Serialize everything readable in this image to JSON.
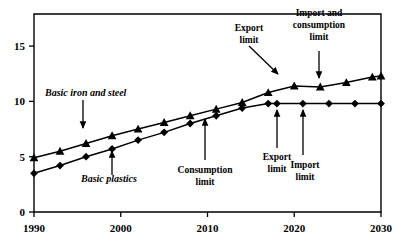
{
  "chart_data": {
    "type": "line",
    "title": "",
    "xlabel": "",
    "ylabel": "",
    "xlim": [
      1990,
      2030
    ],
    "ylim": [
      0,
      17.9
    ],
    "grid": false,
    "legend_position": "none",
    "xticks": [
      1990,
      2000,
      2010,
      2020,
      2030
    ],
    "xticklabels": [
      "1990",
      "2000",
      "2010",
      "2020",
      "2030"
    ],
    "yticks": [
      0,
      5,
      10,
      15
    ],
    "yticklabels": [
      "0",
      "5",
      "10",
      "15"
    ],
    "series": [
      {
        "name": "Basic iron and steel",
        "marker": "triangle",
        "x": [
          1990,
          1993,
          1996,
          1999,
          2002,
          2005,
          2008,
          2011,
          2014,
          2017,
          2020,
          2023,
          2026,
          2029,
          2030
        ],
        "values": [
          4.9,
          5.5,
          6.2,
          6.9,
          7.5,
          8.1,
          8.7,
          9.3,
          9.9,
          10.8,
          11.4,
          11.3,
          11.7,
          12.2,
          12.3
        ]
      },
      {
        "name": "Basic plastics",
        "marker": "diamond",
        "x": [
          1990,
          1993,
          1996,
          1999,
          2002,
          2005,
          2008,
          2011,
          2014,
          2017,
          2018,
          2021,
          2024,
          2027,
          2030
        ],
        "values": [
          3.5,
          4.2,
          5.0,
          5.7,
          6.5,
          7.2,
          8.0,
          8.7,
          9.4,
          9.8,
          9.8,
          9.8,
          9.8,
          9.8,
          9.8
        ]
      }
    ],
    "annotations": [
      {
        "id": "basic-iron-and-steel",
        "text": "Basic iron and steel",
        "style": "series-label",
        "point_x": 1999,
        "point_y": 6.9
      },
      {
        "id": "basic-plastics",
        "text": "Basic plastics",
        "style": "series-label",
        "point_x": 1999,
        "point_y": 5.7
      },
      {
        "id": "export-limit-top",
        "text": "Export limit",
        "line1": "Export",
        "line2": "limit",
        "style": "callout",
        "point_x": 2017,
        "point_y": 10.8
      },
      {
        "id": "import-and-consumption-limit",
        "text": "Import and consumption limit",
        "line1": "Import and",
        "line2": "consumption",
        "line3": "limit",
        "style": "callout",
        "point_x": 2023,
        "point_y": 11.3
      },
      {
        "id": "consumption-limit",
        "text": "Consumption limit",
        "line1": "Consumption",
        "line2": "limit",
        "style": "callout",
        "point_x": 2011,
        "point_y": 8.7
      },
      {
        "id": "export-limit-bottom",
        "text": "Export limit",
        "line1": "Export",
        "line2": "limit",
        "style": "callout",
        "point_x": 2018,
        "point_y": 9.8
      },
      {
        "id": "import-limit",
        "text": "Import limit",
        "line1": "Import",
        "line2": "limit",
        "style": "callout",
        "point_x": 2021,
        "point_y": 9.8
      }
    ]
  }
}
